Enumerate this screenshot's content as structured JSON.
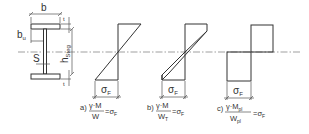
{
  "figure": {
    "centerline_y": 52,
    "colors": {
      "stroke": "#333333",
      "centerline": "#777777",
      "background": "#ffffff"
    }
  },
  "cross_section": {
    "label_width": "b",
    "label_flange_thickness": "t",
    "label_flange_overhang": "b",
    "label_flange_overhang_sub": "u",
    "label_web_thickness": "S",
    "label_web_height": "h",
    "label_web_height_sub": "Steg"
  },
  "diagrams": [
    {
      "id": "a",
      "stress_label": "σ",
      "stress_sub": "F",
      "caption_prefix": "a)",
      "numerator": "γ·M",
      "denominator": "W",
      "denominator_sub": "",
      "numerator_sub": "",
      "rhs": "=σ",
      "rhs_sub": "F",
      "shape": "linear-elastic"
    },
    {
      "id": "b",
      "stress_label": "σ",
      "stress_sub": "F",
      "caption_prefix": "b)",
      "numerator": "γ·M",
      "denominator": "W",
      "denominator_sub": "T",
      "numerator_sub": "",
      "rhs": "=σ",
      "rhs_sub": "F",
      "shape": "elastic-partially-plastic"
    },
    {
      "id": "c",
      "stress_label": "σ",
      "stress_sub": "F",
      "caption_prefix": "c)",
      "numerator": "γ·M",
      "numerator_sub": "pl",
      "denominator": "W",
      "denominator_sub": "pl",
      "rhs": "=σ",
      "rhs_sub": "F",
      "shape": "fully-plastic"
    }
  ]
}
